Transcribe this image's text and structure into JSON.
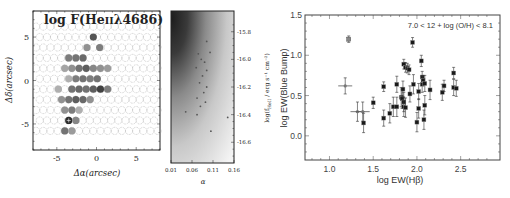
{
  "chart_data": [
    {
      "type": "heatmap",
      "title": "log F(HeIIλ4686)",
      "title_parts": {
        "prefix": "log F(He",
        "ion": "II",
        "suffix": "λ4686)"
      },
      "xlabel": "Δα(arcsec)",
      "ylabel": "Δδ(arcsec)",
      "xticks": [
        "-5",
        "0",
        "5"
      ],
      "yticks": [
        "5",
        "0",
        "-5"
      ],
      "xlim": [
        -8,
        8
      ],
      "ylim": [
        -8,
        8
      ],
      "description": "Hexagonal IFU fiber map; filled grey circles mark spaxels with HeII 4686 detection, darker = higher flux; empty dashed circles = no detection",
      "filled_spaxels": [
        {
          "x": -0.4,
          "y": 5.0,
          "shade": 0.75
        },
        {
          "x": -1.2,
          "y": 3.8,
          "shade": 0.45
        },
        {
          "x": 0.4,
          "y": 3.8,
          "shade": 0.55
        },
        {
          "x": -3.5,
          "y": 2.6,
          "shade": 0.55
        },
        {
          "x": -2.6,
          "y": 2.6,
          "shade": 0.6
        },
        {
          "x": -1.7,
          "y": 2.6,
          "shade": 0.65
        },
        {
          "x": -4.0,
          "y": 1.4,
          "shade": 0.35
        },
        {
          "x": -3.1,
          "y": 1.4,
          "shade": 0.45
        },
        {
          "x": -2.2,
          "y": 1.4,
          "shade": 0.6
        },
        {
          "x": -1.3,
          "y": 1.4,
          "shade": 0.7
        },
        {
          "x": -0.4,
          "y": 1.4,
          "shade": 0.5
        },
        {
          "x": 0.5,
          "y": 1.4,
          "shade": 0.45
        },
        {
          "x": 1.4,
          "y": 1.4,
          "shade": 0.4
        },
        {
          "x": -2.6,
          "y": 0.2,
          "shade": 0.55
        },
        {
          "x": -1.7,
          "y": 0.2,
          "shade": 0.6
        },
        {
          "x": -0.8,
          "y": 0.2,
          "shade": 0.55
        },
        {
          "x": 0.1,
          "y": 0.2,
          "shade": 0.6
        },
        {
          "x": -3.5,
          "y": 0.2,
          "shade": 0.3
        },
        {
          "x": -3.1,
          "y": -1.0,
          "shade": 0.6
        },
        {
          "x": -2.2,
          "y": -1.0,
          "shade": 0.65
        },
        {
          "x": -1.3,
          "y": -1.0,
          "shade": 0.6
        },
        {
          "x": -0.4,
          "y": -1.0,
          "shade": 0.7
        },
        {
          "x": 0.5,
          "y": -1.0,
          "shade": 0.85
        },
        {
          "x": 1.4,
          "y": -1.0,
          "shade": 0.55
        },
        {
          "x": -4.8,
          "y": -1.0,
          "shade": 0.3
        },
        {
          "x": -4.4,
          "y": -2.2,
          "shade": 0.45
        },
        {
          "x": -3.5,
          "y": -2.2,
          "shade": 0.6
        },
        {
          "x": -2.6,
          "y": -2.2,
          "shade": 0.7
        },
        {
          "x": -1.7,
          "y": -2.2,
          "shade": 0.65
        },
        {
          "x": -0.8,
          "y": -2.2,
          "shade": 0.45
        },
        {
          "x": -4.0,
          "y": -3.4,
          "shade": 0.45
        },
        {
          "x": -3.1,
          "y": -3.4,
          "shade": 0.55
        },
        {
          "x": -2.2,
          "y": -3.4,
          "shade": 0.3
        },
        {
          "x": -3.5,
          "y": -4.6,
          "shade": 0.95,
          "marker": "plus"
        },
        {
          "x": -2.6,
          "y": -4.6,
          "shade": 0.5
        },
        {
          "x": -4.0,
          "y": -5.8,
          "shade": 0.6
        },
        {
          "x": -3.1,
          "y": -5.8,
          "shade": 0.4
        }
      ]
    },
    {
      "type": "heatmap",
      "title": "",
      "xlabel": "α",
      "ylabel": "log(f_HeII / erg s⁻¹ cm⁻²)",
      "ylabel_parts": {
        "prefix": "log(f",
        "sub": "HeII",
        "suffix": " / erg s⁻¹ cm⁻²)"
      },
      "xticks": [
        "0.01",
        "0.06",
        "0.11",
        "0.16"
      ],
      "yticks": [
        "-15.8",
        "-16.0",
        "-16.2",
        "-16.4",
        "-16.6"
      ],
      "xlim": [
        0.01,
        0.16
      ],
      "ylim": [
        -16.75,
        -15.65
      ],
      "description": "Probability density greyscale, darkest at low α and bright flux; scattered sample points overlaid",
      "points": [
        {
          "x": 0.095,
          "y": -15.87
        },
        {
          "x": 0.103,
          "y": -15.95
        },
        {
          "x": 0.075,
          "y": -15.96
        },
        {
          "x": 0.082,
          "y": -16.0
        },
        {
          "x": 0.09,
          "y": -16.02
        },
        {
          "x": 0.07,
          "y": -16.06
        },
        {
          "x": 0.095,
          "y": -16.08
        },
        {
          "x": 0.085,
          "y": -16.12
        },
        {
          "x": 0.078,
          "y": -16.17
        },
        {
          "x": 0.095,
          "y": -16.2
        },
        {
          "x": 0.088,
          "y": -16.24
        },
        {
          "x": 0.072,
          "y": -16.28
        },
        {
          "x": 0.092,
          "y": -16.31
        },
        {
          "x": 0.08,
          "y": -16.34
        },
        {
          "x": 0.045,
          "y": -16.38
        },
        {
          "x": 0.072,
          "y": -16.4
        },
        {
          "x": 0.145,
          "y": -16.42
        },
        {
          "x": 0.105,
          "y": -16.52
        }
      ]
    },
    {
      "type": "scatter",
      "title": "",
      "annotation": "7.0 < 12 + log (O/H) < 8.1",
      "xlabel": "log EW(Hβ)",
      "ylabel": "log EW(Blue Bump)",
      "xticks": [
        "1.0",
        "1.5",
        "2.0",
        "2.5"
      ],
      "yticks": [
        "0.0",
        "0.5",
        "1.0",
        "1.5"
      ],
      "xlim": [
        0.72,
        2.95
      ],
      "ylim": [
        -0.3,
        1.5
      ],
      "grid": false,
      "series": [
        {
          "name": "filled squares",
          "marker": "square-filled",
          "points": [
            {
              "x": 1.5,
              "y": 0.41,
              "yerr": 0.07
            },
            {
              "x": 1.62,
              "y": 0.22,
              "yerr": 0.1
            },
            {
              "x": 1.69,
              "y": 0.28,
              "yerr": 0.12
            },
            {
              "x": 1.62,
              "y": 0.61,
              "yerr": 0.06
            },
            {
              "x": 1.73,
              "y": 0.36,
              "yerr": 0.12
            },
            {
              "x": 1.77,
              "y": 0.36,
              "yerr": 0.12
            },
            {
              "x": 1.77,
              "y": 0.64,
              "yerr": 0.1
            },
            {
              "x": 1.82,
              "y": 0.48,
              "yerr": 0.12
            },
            {
              "x": 1.83,
              "y": 0.46,
              "yerr": 0.12
            },
            {
              "x": 1.84,
              "y": 0.58,
              "yerr": 0.1
            },
            {
              "x": 1.85,
              "y": 0.42,
              "yerr": 0.12
            },
            {
              "x": 1.85,
              "y": 0.36,
              "yerr": 0.12
            },
            {
              "x": 1.87,
              "y": 0.35,
              "yerr": 0.12
            },
            {
              "x": 1.85,
              "y": 0.89,
              "yerr": 0.06
            },
            {
              "x": 1.87,
              "y": 0.85,
              "yerr": 0.06
            },
            {
              "x": 1.89,
              "y": 0.84,
              "yerr": 0.06
            },
            {
              "x": 1.91,
              "y": 0.82,
              "yerr": 0.06
            },
            {
              "x": 1.95,
              "y": 1.16,
              "yerr": 0.06
            },
            {
              "x": 1.92,
              "y": 0.52,
              "yerr": 0.1
            },
            {
              "x": 1.96,
              "y": 0.64,
              "yerr": 0.12
            },
            {
              "x": 2.0,
              "y": 0.17,
              "yerr": 0.12
            },
            {
              "x": 2.02,
              "y": 0.34,
              "yerr": 0.12
            },
            {
              "x": 2.02,
              "y": 0.55,
              "yerr": 0.1
            },
            {
              "x": 2.05,
              "y": 0.93,
              "yerr": 0.07
            },
            {
              "x": 2.06,
              "y": 0.73,
              "yerr": 0.07
            },
            {
              "x": 2.06,
              "y": 0.64,
              "yerr": 0.1
            },
            {
              "x": 2.07,
              "y": 0.69,
              "yerr": 0.06
            },
            {
              "x": 2.09,
              "y": 0.65,
              "yerr": 0.1
            },
            {
              "x": 2.08,
              "y": 0.2,
              "yerr": 0.12
            },
            {
              "x": 2.09,
              "y": 0.38,
              "yerr": 0.12
            },
            {
              "x": 2.15,
              "y": 0.57,
              "yerr": 0.12
            },
            {
              "x": 2.29,
              "y": 0.54,
              "yerr": 0.1
            },
            {
              "x": 2.31,
              "y": 0.62,
              "yerr": 0.07
            },
            {
              "x": 2.42,
              "y": 0.78,
              "yerr": 0.07
            },
            {
              "x": 2.42,
              "y": 0.6,
              "yerr": 0.1
            },
            {
              "x": 2.45,
              "y": 0.59,
              "yerr": 0.1
            }
          ]
        },
        {
          "name": "grey squares",
          "marker": "square-grey",
          "points": [
            {
              "x": 1.22,
              "y": 1.2,
              "yerr": 0.04
            }
          ]
        },
        {
          "name": "crosses (upper limit / open)",
          "marker": "cross",
          "points": [
            {
              "x": 1.18,
              "y": 0.62,
              "yerr": 0.1,
              "xerr": 0.08
            },
            {
              "x": 1.32,
              "y": 0.3,
              "yerr": 0.12,
              "xerr": 0.08
            },
            {
              "x": 1.38,
              "y": 0.3,
              "yerr": 0.12,
              "xerr": 0.08
            }
          ]
        },
        {
          "name": "dark square with large error",
          "marker": "square-filled",
          "points": [
            {
              "x": 1.39,
              "y": 0.16,
              "yerr": 0.12
            }
          ]
        }
      ]
    }
  ],
  "colors": {
    "axis": "#222222",
    "filled_marker": "#1a1a1a",
    "grey_marker": "#888888",
    "dashed_circle": "#9a9a9a",
    "density_dark": "#1e1e1e",
    "density_light": "#f4f4f4"
  }
}
